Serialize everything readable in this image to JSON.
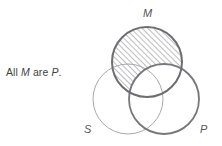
{
  "figure": {
    "kind": "venn-syllogism-diagram",
    "caption": {
      "full_text": "All M are P.",
      "lead": "All ",
      "term_major": "M",
      "middle": " are ",
      "term_minor": "P",
      "trailing": "."
    },
    "circles": [
      {
        "id": "m",
        "label": "M",
        "cx": 147,
        "cy": 62,
        "r": 35,
        "stroke": "#6d6d72",
        "stroke_width": 2.0,
        "label_x": 147,
        "label_y": 14
      },
      {
        "id": "s",
        "label": "S",
        "cx": 128,
        "cy": 99,
        "r": 35,
        "stroke": "#a9a9ad",
        "stroke_width": 1.0,
        "label_x": 88,
        "label_y": 130
      },
      {
        "id": "p",
        "label": "P",
        "cx": 164,
        "cy": 99,
        "r": 35,
        "stroke": "#77777c",
        "stroke_width": 1.8,
        "label_x": 204,
        "label_y": 130
      }
    ],
    "shading": {
      "region": "M minus P",
      "pattern": "diagonal-hatch",
      "direction": "lower-left-to-upper-right",
      "spacing_px": 4,
      "color": "#6d6d72",
      "line_width": 0.9
    },
    "colors": {
      "background": "#ffffff",
      "caption_text": "#3f3f3f",
      "label_text": "#55555a",
      "hatch": "#6d6d72"
    }
  }
}
